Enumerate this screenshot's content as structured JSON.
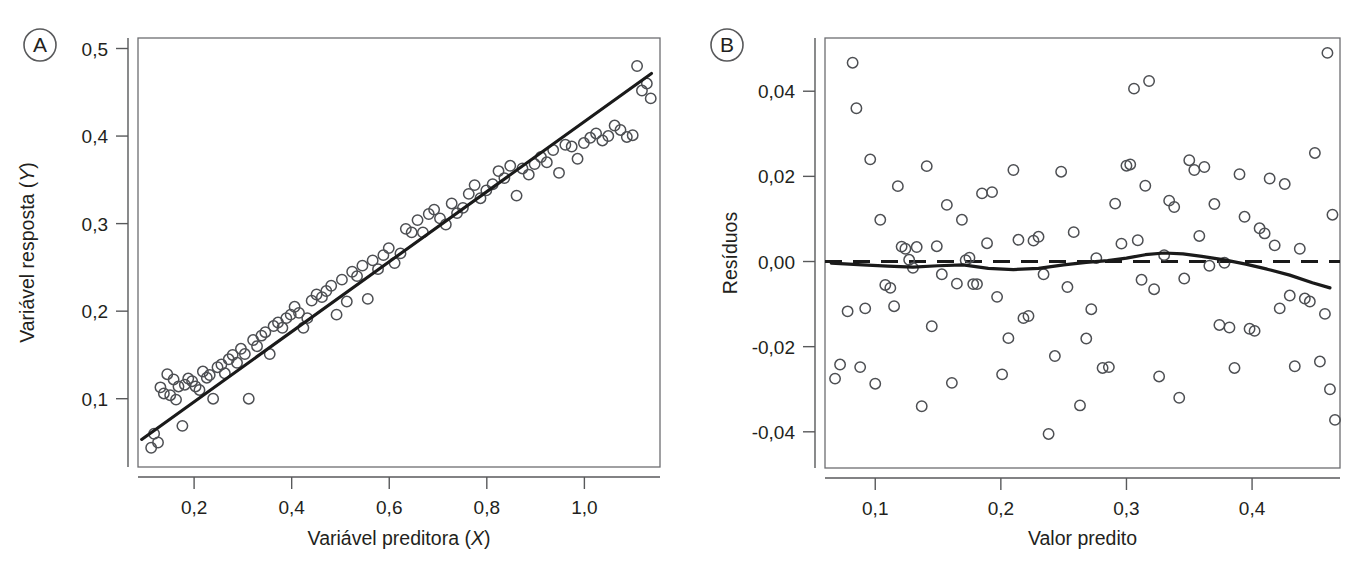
{
  "figure": {
    "background": "#ffffff",
    "point_color": "#4d4f53",
    "line_color": "#1a1a1a",
    "axis_color": "#58595b"
  },
  "panels": [
    {
      "id": "A",
      "badge_label": "A"
    },
    {
      "id": "B",
      "badge_label": "B"
    }
  ],
  "chart_data": [
    {
      "type": "scatter",
      "panel": "A",
      "title": "",
      "xlabel": "Variável preditora (X)",
      "xlabel_plain": "Variável preditora (",
      "xlabel_italic": "X",
      "xlabel_tail": ")",
      "ylabel": "Variável resposta (Y)",
      "ylabel_plain": "Variável resposta (",
      "ylabel_italic": "Y",
      "ylabel_tail": ")",
      "xlim": [
        0.085,
        1.155
      ],
      "ylim": [
        0.022,
        0.512
      ],
      "xticks": [
        0.2,
        0.4,
        0.6,
        0.8,
        1.0
      ],
      "xticklabels": [
        "0,2",
        "0,4",
        "0,6",
        "0,8",
        "1,0"
      ],
      "yticks": [
        0.1,
        0.2,
        0.3,
        0.4,
        0.5
      ],
      "yticklabels": [
        "0,1",
        "0,2",
        "0,3",
        "0,4",
        "0,5"
      ],
      "grid": false,
      "legend": "none",
      "marker": "open-circle",
      "fit": {
        "kind": "linear",
        "label": "regression line",
        "x": [
          0.0925,
          1.1375
        ],
        "y": [
          0.0535,
          0.4715
        ]
      },
      "x": [
        0.112,
        0.118,
        0.126,
        0.131,
        0.138,
        0.145,
        0.151,
        0.158,
        0.163,
        0.168,
        0.176,
        0.181,
        0.188,
        0.196,
        0.203,
        0.211,
        0.218,
        0.226,
        0.232,
        0.239,
        0.248,
        0.256,
        0.263,
        0.271,
        0.279,
        0.288,
        0.296,
        0.304,
        0.312,
        0.321,
        0.329,
        0.338,
        0.346,
        0.355,
        0.363,
        0.372,
        0.381,
        0.389,
        0.398,
        0.406,
        0.415,
        0.424,
        0.432,
        0.441,
        0.451,
        0.462,
        0.471,
        0.481,
        0.492,
        0.503,
        0.513,
        0.524,
        0.534,
        0.545,
        0.556,
        0.566,
        0.577,
        0.588,
        0.599,
        0.611,
        0.623,
        0.634,
        0.646,
        0.658,
        0.669,
        0.681,
        0.692,
        0.704,
        0.716,
        0.728,
        0.739,
        0.751,
        0.763,
        0.775,
        0.787,
        0.799,
        0.812,
        0.824,
        0.836,
        0.848,
        0.861,
        0.873,
        0.886,
        0.898,
        0.911,
        0.923,
        0.936,
        0.948,
        0.961,
        0.974,
        0.986,
        0.999,
        1.012,
        1.024,
        1.037,
        1.049,
        1.062,
        1.074,
        1.087,
        1.099,
        1.108,
        1.118,
        1.128,
        1.136
      ],
      "y": [
        0.044,
        0.06,
        0.05,
        0.113,
        0.106,
        0.128,
        0.104,
        0.122,
        0.099,
        0.114,
        0.069,
        0.116,
        0.123,
        0.12,
        0.114,
        0.11,
        0.131,
        0.124,
        0.127,
        0.1,
        0.136,
        0.139,
        0.129,
        0.145,
        0.15,
        0.141,
        0.157,
        0.151,
        0.1,
        0.167,
        0.16,
        0.172,
        0.176,
        0.151,
        0.183,
        0.187,
        0.181,
        0.192,
        0.196,
        0.205,
        0.198,
        0.181,
        0.192,
        0.212,
        0.219,
        0.216,
        0.223,
        0.229,
        0.196,
        0.236,
        0.211,
        0.245,
        0.24,
        0.252,
        0.214,
        0.258,
        0.248,
        0.264,
        0.272,
        0.255,
        0.266,
        0.294,
        0.29,
        0.304,
        0.29,
        0.311,
        0.316,
        0.306,
        0.299,
        0.323,
        0.312,
        0.318,
        0.334,
        0.344,
        0.329,
        0.338,
        0.345,
        0.36,
        0.352,
        0.366,
        0.332,
        0.363,
        0.356,
        0.368,
        0.376,
        0.37,
        0.384,
        0.358,
        0.39,
        0.388,
        0.374,
        0.392,
        0.398,
        0.403,
        0.395,
        0.4,
        0.412,
        0.407,
        0.399,
        0.401,
        0.48,
        0.452,
        0.46,
        0.443
      ]
    },
    {
      "type": "scatter",
      "panel": "B",
      "title": "",
      "xlabel": "Valor predito",
      "ylabel": "Resíduos",
      "xlim": [
        0.06,
        0.47
      ],
      "ylim": [
        -0.0485,
        0.0525
      ],
      "xticks": [
        0.1,
        0.2,
        0.3,
        0.4
      ],
      "xticklabels": [
        "0,1",
        "0,2",
        "0,3",
        "0,4"
      ],
      "yticks": [
        -0.04,
        -0.02,
        0.0,
        0.02,
        0.04
      ],
      "yticklabels": [
        "-0,04",
        "-0,02",
        "0,00",
        "0,02",
        "0,04"
      ],
      "grid": false,
      "legend": "none",
      "marker": "open-circle",
      "reference_line": {
        "kind": "dashed-horizontal",
        "label": "zero residual line",
        "y": 0.0
      },
      "fit": {
        "kind": "loess",
        "label": "loess smoother",
        "x": [
          0.065,
          0.09,
          0.11,
          0.13,
          0.15,
          0.17,
          0.19,
          0.21,
          0.23,
          0.25,
          0.268,
          0.285,
          0.3,
          0.315,
          0.33,
          0.345,
          0.36,
          0.378,
          0.395,
          0.412,
          0.43,
          0.448,
          0.462
        ],
        "y": [
          -0.0004,
          -0.0008,
          -0.0011,
          -0.0013,
          -0.001,
          -0.0008,
          -0.0016,
          -0.0019,
          -0.0016,
          -0.0008,
          -0.0002,
          0.0002,
          0.0008,
          0.0016,
          0.002,
          0.0018,
          0.0012,
          0.0004,
          -0.0006,
          -0.0018,
          -0.0032,
          -0.005,
          -0.0062
        ]
      },
      "x": [
        0.068,
        0.072,
        0.078,
        0.082,
        0.085,
        0.088,
        0.092,
        0.096,
        0.1,
        0.104,
        0.108,
        0.112,
        0.115,
        0.118,
        0.121,
        0.124,
        0.127,
        0.13,
        0.133,
        0.137,
        0.141,
        0.145,
        0.149,
        0.153,
        0.157,
        0.161,
        0.165,
        0.169,
        0.172,
        0.175,
        0.178,
        0.181,
        0.185,
        0.189,
        0.193,
        0.197,
        0.201,
        0.206,
        0.21,
        0.214,
        0.218,
        0.222,
        0.226,
        0.23,
        0.234,
        0.238,
        0.243,
        0.248,
        0.253,
        0.258,
        0.263,
        0.268,
        0.272,
        0.276,
        0.281,
        0.286,
        0.291,
        0.296,
        0.3,
        0.303,
        0.306,
        0.309,
        0.312,
        0.315,
        0.318,
        0.322,
        0.326,
        0.33,
        0.334,
        0.338,
        0.342,
        0.346,
        0.35,
        0.354,
        0.358,
        0.362,
        0.366,
        0.37,
        0.374,
        0.378,
        0.382,
        0.386,
        0.39,
        0.394,
        0.398,
        0.402,
        0.406,
        0.41,
        0.414,
        0.418,
        0.422,
        0.426,
        0.43,
        0.434,
        0.438,
        0.442,
        0.446,
        0.45,
        0.454,
        0.458,
        0.46,
        0.462,
        0.464,
        0.466
      ],
      "y": [
        -0.0275,
        -0.0242,
        -0.0117,
        0.0467,
        0.036,
        -0.0248,
        -0.011,
        0.024,
        -0.0287,
        0.0098,
        -0.0055,
        -0.0062,
        -0.0105,
        0.0177,
        0.0035,
        0.003,
        0.0004,
        -0.0015,
        0.0034,
        -0.034,
        0.0224,
        -0.0152,
        0.0036,
        -0.003,
        0.0133,
        -0.0285,
        -0.0052,
        0.0098,
        0.0003,
        0.0009,
        -0.0053,
        -0.0053,
        0.016,
        0.0043,
        0.0163,
        -0.0083,
        -0.0265,
        -0.018,
        0.0215,
        0.0051,
        -0.0133,
        -0.0128,
        0.0049,
        0.0058,
        -0.003,
        -0.0405,
        -0.0222,
        0.0211,
        -0.006,
        0.0069,
        -0.0338,
        -0.0181,
        -0.0112,
        0.0008,
        -0.025,
        -0.0248,
        0.0136,
        0.0042,
        0.0225,
        0.0228,
        0.0406,
        0.005,
        -0.0043,
        0.0178,
        0.0424,
        -0.0065,
        -0.027,
        0.0015,
        0.0143,
        0.0128,
        -0.032,
        -0.004,
        0.0238,
        0.0215,
        0.006,
        0.0222,
        -0.001,
        0.0135,
        -0.0149,
        -0.0003,
        -0.0155,
        -0.025,
        0.0205,
        0.0105,
        -0.0158,
        -0.0163,
        0.0078,
        0.0066,
        0.0195,
        0.0038,
        -0.011,
        0.0182,
        -0.008,
        -0.0246,
        0.003,
        -0.0087,
        -0.0094,
        0.0255,
        -0.0235,
        -0.0123,
        0.049,
        -0.03,
        0.011,
        -0.0372
      ]
    }
  ]
}
